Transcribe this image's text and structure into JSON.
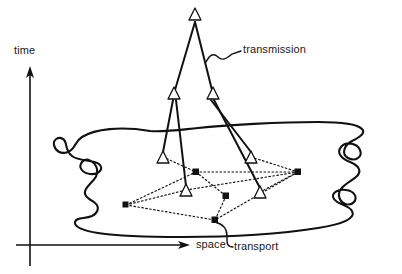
{
  "figure": {
    "type": "schematic-diagram",
    "title": "",
    "background_color": "#ffffff",
    "stroke_color": "#111111"
  },
  "axes": {
    "vertical": {
      "label": "time",
      "direction": "up",
      "arrow": true,
      "origin": [
        30,
        245
      ],
      "tip": [
        30,
        72
      ]
    },
    "horizontal": {
      "label": "space",
      "direction": "right",
      "arrow": true,
      "origin": [
        16,
        245
      ],
      "tip": [
        190,
        245
      ]
    }
  },
  "annotations": [
    {
      "name": "transmission",
      "label": "transmission",
      "label_position": [
        243,
        49
      ],
      "leader": "squiggle",
      "points_to": "transmission-lines"
    },
    {
      "name": "transport",
      "label": "transport",
      "label_position": [
        270,
        243
      ],
      "leader": "hook",
      "points_to": "transport-network"
    }
  ],
  "region": {
    "name": "space-blob",
    "description": "irregular closed wavy outline representing the spatial domain"
  },
  "nodes": {
    "triangle_label": "triangle-node",
    "square_label": "square-node",
    "apex": {
      "x": 195,
      "y": 14
    },
    "middle": [
      {
        "x": 174,
        "y": 93
      },
      {
        "x": 213,
        "y": 93
      }
    ],
    "ground_triangles": [
      {
        "x": 163,
        "y": 157
      },
      {
        "x": 260,
        "y": 192
      },
      {
        "x": 186,
        "y": 190
      },
      {
        "x": 251,
        "y": 157
      }
    ],
    "squares": [
      {
        "x": 126,
        "y": 205
      },
      {
        "x": 196,
        "y": 172
      },
      {
        "x": 298,
        "y": 172
      },
      {
        "x": 226,
        "y": 196
      },
      {
        "x": 215,
        "y": 220
      }
    ]
  },
  "links": {
    "transmission_style": "solid",
    "transport_style": "dotted",
    "transmission_pairs": [
      [
        "apex",
        "middle-0"
      ],
      [
        "apex",
        "middle-1"
      ],
      [
        "middle-0",
        "ground-0"
      ],
      [
        "middle-0",
        "ground-2"
      ],
      [
        "middle-1",
        "ground-3"
      ],
      [
        "middle-1",
        "ground-1"
      ]
    ],
    "transport_pairs": [
      [
        "ground-0",
        "square-1"
      ],
      [
        "square-1",
        "square-2"
      ],
      [
        "square-1",
        "square-3"
      ],
      [
        "square-0",
        "square-1"
      ],
      [
        "square-0",
        "square-4"
      ],
      [
        "square-3",
        "square-4"
      ],
      [
        "ground-2",
        "square-2"
      ],
      [
        "ground-1",
        "square-2"
      ],
      [
        "square-2",
        "square-4"
      ],
      [
        "ground-3",
        "square-2"
      ],
      [
        "square-0",
        "ground-2"
      ]
    ]
  }
}
